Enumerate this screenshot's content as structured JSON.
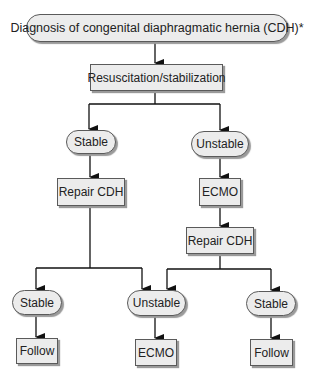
{
  "diagram": {
    "type": "flowchart",
    "root": {
      "label": "Diagnosis of congenital diaphragmatic hernia (CDH)*",
      "shape": "pill"
    },
    "step1": {
      "label": "Resuscitation/stabilization",
      "shape": "rect"
    },
    "level2": {
      "left": {
        "label": "Stable",
        "shape": "pill"
      },
      "right": {
        "label": "Unstable",
        "shape": "pill"
      }
    },
    "level3": {
      "left": {
        "label": "Repair CDH",
        "shape": "rect"
      },
      "right": {
        "label": "ECMO",
        "shape": "rect"
      }
    },
    "level4": {
      "right": {
        "label": "Repair CDH",
        "shape": "rect"
      }
    },
    "level5": {
      "left": {
        "label": "Stable",
        "shape": "pill"
      },
      "middle": {
        "label": "Unstable",
        "shape": "pill"
      },
      "right": {
        "label": "Stable",
        "shape": "pill"
      }
    },
    "level6": {
      "left": {
        "label": "Follow",
        "shape": "rect"
      },
      "middle": {
        "label": "ECMO",
        "shape": "rect"
      },
      "right": {
        "label": "Follow",
        "shape": "rect"
      }
    },
    "edges": [
      [
        "Diagnosis of CDH",
        "Resuscitation/stabilization"
      ],
      [
        "Resuscitation/stabilization",
        "Stable"
      ],
      [
        "Resuscitation/stabilization",
        "Unstable"
      ],
      [
        "Stable",
        "Repair CDH (left)"
      ],
      [
        "Unstable",
        "ECMO"
      ],
      [
        "ECMO",
        "Repair CDH (right)"
      ],
      [
        "Repair CDH (left)",
        "Stable (bottom-left)"
      ],
      [
        "Repair CDH (left)",
        "Unstable (bottom-middle)"
      ],
      [
        "Repair CDH (right)",
        "Unstable (bottom-middle)"
      ],
      [
        "Repair CDH (right)",
        "Stable (bottom-right)"
      ],
      [
        "Stable (bottom-left)",
        "Follow (left)"
      ],
      [
        "Unstable (bottom-middle)",
        "ECMO (bottom)"
      ],
      [
        "Stable (bottom-right)",
        "Follow (right)"
      ]
    ],
    "colors": {
      "node_fill": "#ececec",
      "border": "#5a5a5a",
      "shadow": "#9a9a9a",
      "line": "#111111"
    }
  }
}
